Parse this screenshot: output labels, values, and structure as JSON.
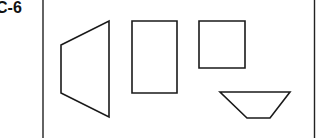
{
  "figure": {
    "label": "C-6",
    "frame": {
      "left_line_x": 43,
      "right_line_x": 314.5,
      "stroke": "#222222"
    },
    "shapes": [
      {
        "name": "trapezoid-left",
        "type": "polygon",
        "points": "61,45 109,21 109,117 61,93"
      },
      {
        "name": "tall-rectangle",
        "type": "polygon",
        "points": "132,21 177,21 177,93 132,93"
      },
      {
        "name": "square",
        "type": "polygon",
        "points": "199,21 245,21 245,68 199,68"
      },
      {
        "name": "inverted-trapezoid",
        "type": "polygon",
        "points": "220,92 290,92 270,118 247,118"
      }
    ],
    "stroke_color": "#1a1a1a",
    "stroke_width": 1.6
  }
}
